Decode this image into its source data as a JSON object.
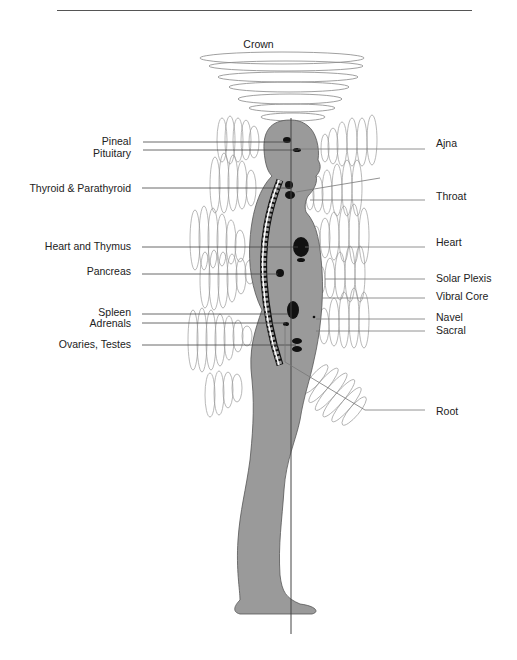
{
  "title": "Crown",
  "colors": {
    "body_fill": "#9a9a9a",
    "organ_fill": "#111111",
    "line": "#444444",
    "aura_line": "#888888"
  },
  "left_labels": [
    {
      "text": "Pineal",
      "y": 141
    },
    {
      "text": "Pituitary",
      "y": 152
    },
    {
      "text": "Thyroid & Parathyroid",
      "y": 187
    },
    {
      "text": "Heart and Thymus",
      "y": 246
    },
    {
      "text": "Pancreas",
      "y": 271
    },
    {
      "text": "Spleen",
      "y": 311
    },
    {
      "text": "Adrenals",
      "y": 323
    },
    {
      "text": "Ovaries, Testes",
      "y": 344
    }
  ],
  "right_labels": [
    {
      "text": "Ajna",
      "y": 143
    },
    {
      "text": "Throat",
      "y": 196
    },
    {
      "text": "Heart",
      "y": 242
    },
    {
      "text": "Solar Plexis",
      "y": 278
    },
    {
      "text": "Vibral Core",
      "y": 296
    },
    {
      "text": "Navel",
      "y": 316
    },
    {
      "text": "Sacral",
      "y": 330
    },
    {
      "text": "Root",
      "y": 411
    }
  ]
}
